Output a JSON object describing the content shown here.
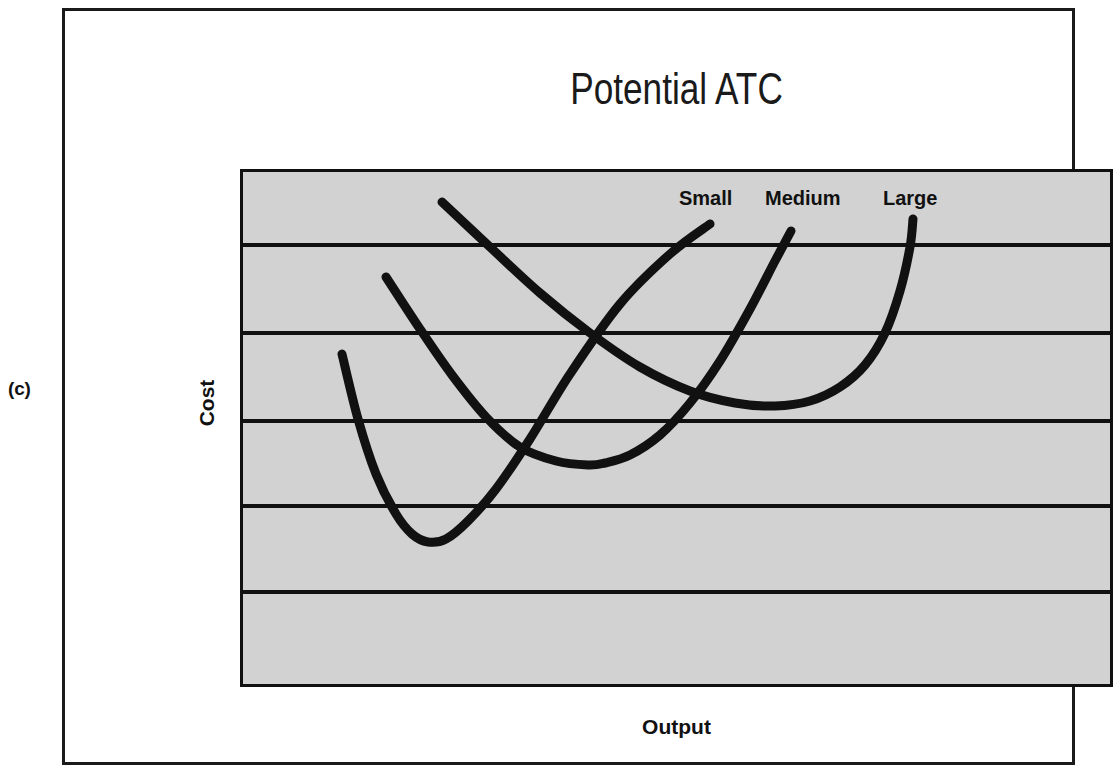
{
  "figure": {
    "panel_label": "(c)",
    "title": "Potential ATC",
    "xlabel": "Output",
    "ylabel": "Cost",
    "colors": {
      "plot_background": "#d2d2d2",
      "frame": "#111111",
      "curve": "#111111",
      "gridline": "#111111",
      "page_background": "#ffffff"
    }
  },
  "labels": {
    "small": "Small",
    "medium": "Medium",
    "large": "Large"
  },
  "chart_data": {
    "type": "line",
    "title": "Potential ATC",
    "xlabel": "Output",
    "ylabel": "Cost",
    "grid": true,
    "gridlines_horizontal": 5,
    "axis_ticks": false,
    "legend": "inline-labels-above-curves",
    "xlim": [
      0,
      873
    ],
    "ylim": [
      0,
      518
    ],
    "note": "Three U-shaped short-run average total cost curves of increasing plant size; minima shift right and the minimum cost rises for larger plants.",
    "series": [
      {
        "name": "Small",
        "label": "Small",
        "minimum": {
          "x": 188,
          "y": 373
        },
        "start": {
          "x": 102,
          "y": 185
        },
        "end": {
          "x": 470,
          "y": 55
        },
        "points": [
          [
            102,
            185
          ],
          [
            118,
            250
          ],
          [
            136,
            305
          ],
          [
            156,
            345
          ],
          [
            172,
            365
          ],
          [
            188,
            373
          ],
          [
            206,
            370
          ],
          [
            228,
            352
          ],
          [
            256,
            320
          ],
          [
            290,
            270
          ],
          [
            330,
            205
          ],
          [
            380,
            135
          ],
          [
            430,
            85
          ],
          [
            470,
            55
          ]
        ]
      },
      {
        "name": "Medium",
        "label": "Medium",
        "minimum": {
          "x": 365,
          "y": 294
        },
        "start": {
          "x": 146,
          "y": 108
        },
        "end": {
          "x": 551,
          "y": 62
        },
        "points": [
          [
            146,
            108
          ],
          [
            180,
            160
          ],
          [
            212,
            206
          ],
          [
            246,
            248
          ],
          [
            280,
            278
          ],
          [
            316,
            292
          ],
          [
            348,
            296
          ],
          [
            365,
            294
          ],
          [
            390,
            286
          ],
          [
            420,
            266
          ],
          [
            450,
            234
          ],
          [
            480,
            192
          ],
          [
            510,
            140
          ],
          [
            535,
            92
          ],
          [
            551,
            62
          ]
        ]
      },
      {
        "name": "Large",
        "label": "Large",
        "minimum": {
          "x": 535,
          "y": 237
        },
        "start": {
          "x": 202,
          "y": 33
        },
        "end": {
          "x": 673,
          "y": 50
        },
        "points": [
          [
            202,
            33
          ],
          [
            250,
            78
          ],
          [
            300,
            124
          ],
          [
            350,
            164
          ],
          [
            400,
            198
          ],
          [
            450,
            222
          ],
          [
            495,
            234
          ],
          [
            535,
            237
          ],
          [
            570,
            232
          ],
          [
            600,
            218
          ],
          [
            625,
            196
          ],
          [
            645,
            164
          ],
          [
            660,
            122
          ],
          [
            670,
            78
          ],
          [
            673,
            50
          ]
        ]
      }
    ],
    "gridline_positions_y": [
      73,
      161,
      249,
      334,
      420
    ]
  }
}
